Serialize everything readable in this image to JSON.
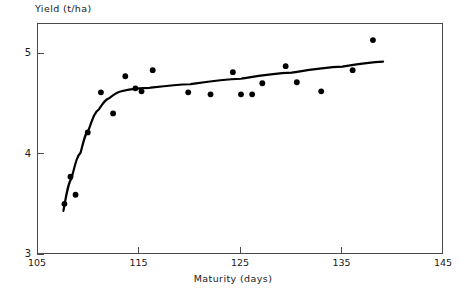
{
  "chart_data": {
    "type": "scatter",
    "title": "",
    "xlabel": "Maturity (days)",
    "ylabel": "Yield (t/ha)",
    "xlim": [
      105,
      145
    ],
    "ylim": [
      3,
      5.3
    ],
    "xticks": [
      105,
      115,
      125,
      135,
      145
    ],
    "xtick_labels": [
      "105",
      "115",
      "125",
      "135",
      "145"
    ],
    "yticks": [
      3,
      4,
      5
    ],
    "ytick_labels": [
      "3",
      "4",
      "5"
    ],
    "grid": false,
    "legend": null,
    "marker": "filled-circle",
    "marker_color": "#000000",
    "line_color": "#000000",
    "points": [
      {
        "x": 107.6,
        "y": 3.51
      },
      {
        "x": 108.2,
        "y": 3.78
      },
      {
        "x": 108.7,
        "y": 3.6
      },
      {
        "x": 109.9,
        "y": 4.22
      },
      {
        "x": 111.2,
        "y": 4.62
      },
      {
        "x": 112.4,
        "y": 4.41
      },
      {
        "x": 113.6,
        "y": 4.78
      },
      {
        "x": 114.6,
        "y": 4.66
      },
      {
        "x": 115.2,
        "y": 4.63
      },
      {
        "x": 116.3,
        "y": 4.84
      },
      {
        "x": 119.8,
        "y": 4.62
      },
      {
        "x": 122.0,
        "y": 4.6
      },
      {
        "x": 124.2,
        "y": 4.82
      },
      {
        "x": 125.0,
        "y": 4.6
      },
      {
        "x": 126.1,
        "y": 4.6
      },
      {
        "x": 127.1,
        "y": 4.71
      },
      {
        "x": 129.4,
        "y": 4.88
      },
      {
        "x": 130.5,
        "y": 4.72
      },
      {
        "x": 132.9,
        "y": 4.63
      },
      {
        "x": 136.0,
        "y": 4.84
      },
      {
        "x": 138.0,
        "y": 5.14
      }
    ],
    "fit_curve": {
      "description": "fitted broken-stick / plateau response curve",
      "nodes": [
        {
          "x": 107.5,
          "y": 3.44
        },
        {
          "x": 108.3,
          "y": 3.76
        },
        {
          "x": 109.2,
          "y": 4.02
        },
        {
          "x": 110.0,
          "y": 4.25
        },
        {
          "x": 111.0,
          "y": 4.45
        },
        {
          "x": 112.0,
          "y": 4.56
        },
        {
          "x": 113.2,
          "y": 4.63
        },
        {
          "x": 114.5,
          "y": 4.655
        },
        {
          "x": 116.0,
          "y": 4.665
        },
        {
          "x": 120.0,
          "y": 4.7
        },
        {
          "x": 125.0,
          "y": 4.755
        },
        {
          "x": 130.0,
          "y": 4.815
        },
        {
          "x": 135.0,
          "y": 4.875
        },
        {
          "x": 139.0,
          "y": 4.925
        }
      ]
    }
  },
  "axes": {
    "frame": {
      "left_px": 37,
      "top_px": 23,
      "width_px": 406,
      "height_px": 231
    }
  }
}
